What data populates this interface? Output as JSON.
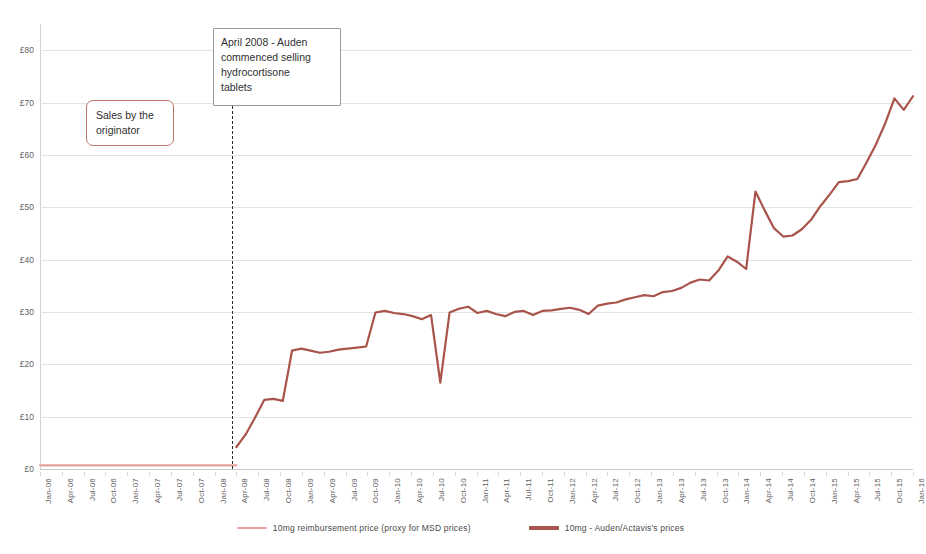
{
  "chart_data": {
    "type": "line",
    "title": "",
    "xlabel": "",
    "ylabel": "",
    "ylim": [
      0,
      85
    ],
    "y_ticks": [
      "£0",
      "£10",
      "£20",
      "£30",
      "£40",
      "£50",
      "£60",
      "£70",
      "£80"
    ],
    "y_tick_values": [
      0,
      10,
      20,
      30,
      40,
      50,
      60,
      70,
      80
    ],
    "grid": true,
    "legend_position": "bottom",
    "currency": "GBP",
    "categories": [
      "Jan-06",
      "Apr-06",
      "Jul-06",
      "Oct-06",
      "Jan-07",
      "Apr-07",
      "Jul-07",
      "Oct-07",
      "Jan-08",
      "Apr-08",
      "Jul-08",
      "Oct-08",
      "Jan-09",
      "Apr-09",
      "Jul-09",
      "Oct-09",
      "Jan-10",
      "Apr-10",
      "Jul-10",
      "Oct-10",
      "Jan-11",
      "Apr-11",
      "Jul-11",
      "Oct-11",
      "Jan-12",
      "Apr-12",
      "Jul-12",
      "Oct-12",
      "Jan-13",
      "Apr-13",
      "Jul-13",
      "Oct-13",
      "Jan-14",
      "Apr-14",
      "Jul-14",
      "Oct-14",
      "Jan-15",
      "Apr-15",
      "Jul-15",
      "Oct-15",
      "Jan-16"
    ],
    "series": [
      {
        "name": "10mg reimbursement price (proxy for MSD prices)",
        "color": "#e3a39a",
        "width": 2.2,
        "values": [
          0.7,
          0.7,
          0.7,
          0.7,
          0.7,
          0.7,
          0.7,
          0.7,
          0.7,
          0.7,
          null,
          null,
          null,
          null,
          null,
          null,
          null,
          null,
          null,
          null,
          null,
          null,
          null,
          null,
          null,
          null,
          null,
          null,
          null,
          null,
          null,
          null,
          null,
          null,
          null,
          null,
          null,
          null,
          null,
          null,
          null
        ],
        "monthly_values": [
          0.7,
          0.7,
          0.7,
          0.7,
          0.7,
          0.7,
          0.7,
          0.7,
          0.7,
          0.7,
          0.7,
          0.7,
          0.7,
          0.7,
          0.7,
          0.7,
          0.7,
          0.7,
          0.7,
          0.7,
          0.7,
          0.7,
          0.7,
          0.7,
          0.7,
          0.7,
          0.7,
          0.7,
          0.7,
          0.7
        ]
      },
      {
        "name": "10mg - Auden/Actavis's prices",
        "color": "#a8544a",
        "width": 2.2,
        "values": [
          null,
          null,
          null,
          null,
          null,
          null,
          null,
          null,
          null,
          4.2,
          13.2,
          22.6,
          22.4,
          23.0,
          23.4,
          29.9,
          29.6,
          28.6,
          16.5,
          30.6,
          29.6,
          29.2,
          30.2,
          30.3,
          30.8,
          29.6,
          31.6,
          32.4,
          33.2,
          34.0,
          35.6,
          37.9,
          40.6,
          53.0,
          44.4,
          47.6,
          54.8,
          58.6,
          66.0,
          70.8,
          71.2
        ],
        "monthly_values": [
          4.2,
          6.6,
          9.8,
          13.2,
          13.4,
          13.0,
          22.6,
          23.0,
          22.6,
          22.2,
          22.4,
          22.8,
          23.0,
          23.2,
          23.4,
          29.9,
          30.2,
          29.8,
          29.6,
          29.2,
          28.6,
          29.4,
          16.5,
          29.9,
          30.6,
          31.0,
          29.8,
          30.2,
          29.6,
          29.2,
          30.0,
          30.2,
          29.4,
          30.2,
          30.3,
          30.6,
          30.8,
          30.4,
          29.6,
          31.2,
          31.6,
          31.8,
          32.4,
          32.8,
          33.2,
          33.0,
          33.8,
          34.0,
          34.6,
          35.6,
          36.2,
          36.0,
          37.9,
          40.6,
          39.6,
          38.2,
          53.0,
          49.4,
          46.0,
          44.4,
          44.6,
          45.8,
          47.6,
          50.2,
          52.4,
          54.8,
          55.0,
          55.4,
          58.6,
          62.0,
          66.0,
          70.8,
          68.6,
          71.2
        ]
      }
    ],
    "annotations": [
      {
        "id": "sales-by-originator",
        "lines": [
          "Sales by the",
          "originator"
        ],
        "border_color": "#c0756a",
        "style": "rounded"
      },
      {
        "id": "april-2008-event",
        "lines": [
          "April 2008 - Auden",
          "commenced selling",
          "hydrocortisone",
          "tablets"
        ],
        "border_color": "#9a9a9a",
        "style": "square",
        "marker": "dashed-vertical-line",
        "marker_category": "Apr-08"
      }
    ]
  }
}
